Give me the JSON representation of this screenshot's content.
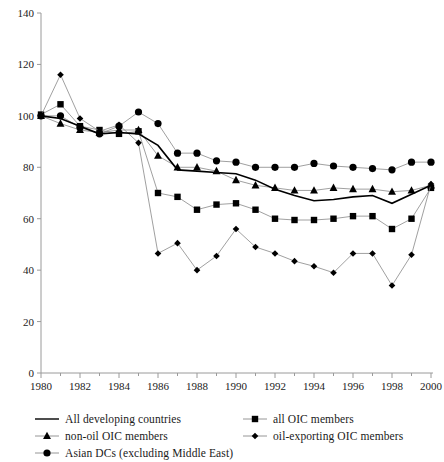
{
  "chart_data": {
    "type": "line",
    "title": "",
    "subtitle": "",
    "xlabel": "",
    "ylabel": "",
    "xlim": [
      1980,
      2000
    ],
    "ylim": [
      0,
      140
    ],
    "ytick_step": 20,
    "xtick_step": 2,
    "grid": false,
    "legend_position": "below",
    "yticks": [
      "0",
      "20",
      "40",
      "60",
      "80",
      "100",
      "120",
      "140"
    ],
    "xticks": [
      "1980",
      "1982",
      "1984",
      "1986",
      "1988",
      "1990",
      "1992",
      "1994",
      "1996",
      "1998",
      "2000"
    ],
    "x": [
      1980,
      1981,
      1982,
      1983,
      1984,
      1985,
      1986,
      1987,
      1988,
      1989,
      1990,
      1991,
      1992,
      1993,
      1994,
      1995,
      1996,
      1997,
      1998,
      1999,
      2000
    ],
    "series": [
      {
        "name": "All developing countries",
        "marker": "none",
        "color": "#000000",
        "values": [
          100,
          99,
          96,
          93,
          93.5,
          93,
          88.5,
          79,
          78.5,
          78,
          77.5,
          75,
          71.5,
          69,
          67,
          67.5,
          68.5,
          69,
          66,
          69.5,
          73
        ]
      },
      {
        "name": "all OIC members",
        "marker": "square",
        "color": "#000000",
        "values": [
          100.5,
          104.5,
          96,
          94.5,
          93,
          94,
          70,
          68.5,
          63.5,
          65.5,
          66,
          63.5,
          60,
          59.5,
          59.5,
          60,
          61,
          61,
          56,
          60,
          72
        ]
      },
      {
        "name": "non-oil OIC members",
        "marker": "triangle",
        "color": "#000000",
        "values": [
          100,
          97,
          94.5,
          93.5,
          94.5,
          94.5,
          84.5,
          80,
          80,
          78.5,
          75,
          73,
          72,
          71,
          71,
          72,
          71.5,
          71.5,
          70.5,
          71,
          73
        ]
      },
      {
        "name": "oil-exporting OIC members",
        "marker": "diamond",
        "color": "#000000",
        "values": [
          100,
          116,
          99,
          94,
          96.5,
          89.5,
          46.5,
          50.5,
          40,
          45.5,
          56,
          49,
          46.5,
          43.5,
          41.5,
          39,
          46.5,
          46.5,
          34,
          46,
          73.5
        ]
      },
      {
        "name": "Asian DCs (excluding Middle East)",
        "marker": "circle",
        "color": "#000000",
        "values": [
          100,
          100,
          95.5,
          93,
          96,
          101.5,
          97,
          85.5,
          85.5,
          82.5,
          82,
          80,
          80,
          80,
          81.5,
          80.5,
          80,
          79.5,
          79,
          82,
          82
        ]
      }
    ]
  },
  "legend": {
    "entries": [
      {
        "label": "All developing countries",
        "marker": "line"
      },
      {
        "label": "all OIC members",
        "marker": "square"
      },
      {
        "label": "non-oil OIC members",
        "marker": "triangle"
      },
      {
        "label": "oil-exporting OIC members",
        "marker": "diamond"
      },
      {
        "label": "Asian DCs (excluding Middle East)",
        "marker": "circle"
      }
    ]
  }
}
